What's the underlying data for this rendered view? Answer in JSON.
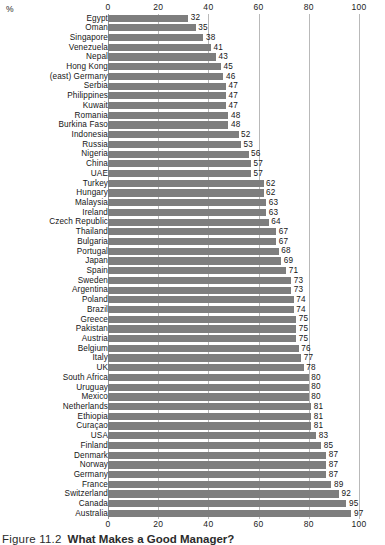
{
  "chart_data": {
    "type": "bar",
    "orientation": "horizontal",
    "title": "What Makes a Good Manager?",
    "figure_number": "Figure 11.2",
    "xlabel": "%",
    "ylabel": "",
    "xlim": [
      0,
      100
    ],
    "xticks": [
      0,
      20,
      40,
      60,
      80,
      100
    ],
    "xticklabels": [
      "0",
      "20",
      "40",
      "60",
      "80",
      "100"
    ],
    "grid": true,
    "legend": false,
    "axis_top": true,
    "axis_bottom": true,
    "bar_color": "#7e7e7e",
    "gridline_color": "#b9b9b9",
    "categories": [
      "Egypt",
      "Oman",
      "Singapore",
      "Venezuela",
      "Nepal",
      "Hong Kong",
      "(east) Germany",
      "Serbia",
      "Philippines",
      "Kuwait",
      "Romania",
      "Burkina Faso",
      "Indonesia",
      "Russia",
      "Nigeria",
      "China",
      "UAE",
      "Turkey",
      "Hungary",
      "Malaysia",
      "Ireland",
      "Czech Republic",
      "Thailand",
      "Bulgaria",
      "Portugal",
      "Japan",
      "Spain",
      "Sweden",
      "Argentina",
      "Poland",
      "Brazil",
      "Greece",
      "Pakistan",
      "Austria",
      "Belgium",
      "Italy",
      "UK",
      "South Africa",
      "Uruguay",
      "Mexico",
      "Netherlands",
      "Ethiopia",
      "Curaçao",
      "USA",
      "Finland",
      "Denmark",
      "Norway",
      "Germany",
      "France",
      "Switzerland",
      "Canada",
      "Australia"
    ],
    "values": [
      32,
      35,
      38,
      41,
      43,
      45,
      46,
      47,
      47,
      47,
      48,
      48,
      52,
      53,
      56,
      57,
      57,
      62,
      62,
      63,
      63,
      64,
      67,
      67,
      68,
      69,
      71,
      73,
      73,
      74,
      74,
      75,
      75,
      75,
      76,
      77,
      78,
      80,
      80,
      80,
      81,
      81,
      81,
      83,
      85,
      87,
      87,
      87,
      89,
      92,
      95,
      97
    ]
  },
  "caption": {
    "figure_label": "Figure 11.2",
    "figure_title": "What Makes a Good Manager?"
  }
}
